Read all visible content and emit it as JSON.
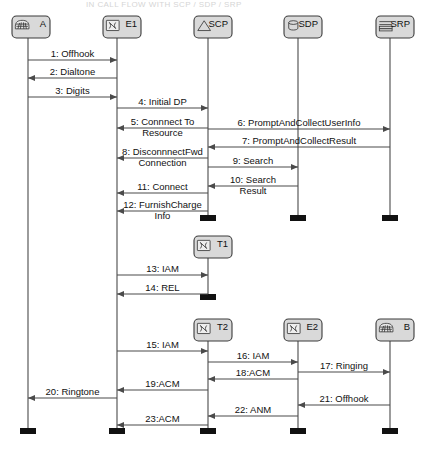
{
  "diagram": {
    "type": "uml-sequence-diagram",
    "title_clipped": "IN CALL FLOW WITH SCP / SDP / SRP",
    "width": 431,
    "height": 455,
    "colors": {
      "line": "#4a4a4a",
      "header_fill": "#d9d9d9",
      "header_stroke": "#3a3a3a",
      "terminator": "#111111",
      "background": "#ffffff",
      "text": "#111111"
    },
    "lifelines": [
      {
        "id": "A",
        "label": "A",
        "icon": "telephone-icon",
        "x": 28,
        "box_x": 12,
        "box_y": 16,
        "top": 38,
        "bottom": 432
      },
      {
        "id": "E1",
        "label": "E1",
        "icon": "switch-icon",
        "x": 117,
        "box_x": 103,
        "box_y": 16,
        "top": 38,
        "bottom": 432
      },
      {
        "id": "SCP",
        "label": "SCP",
        "icon": "triangle-icon",
        "x": 208,
        "box_x": 194,
        "box_y": 16,
        "top": 38,
        "bottom": 219
      },
      {
        "id": "SDP",
        "label": "SDP",
        "icon": "database-icon",
        "x": 298,
        "box_x": 284,
        "box_y": 16,
        "top": 38,
        "bottom": 219
      },
      {
        "id": "SRP",
        "label": "SRP",
        "icon": "resource-icon",
        "x": 390,
        "box_x": 376,
        "box_y": 16,
        "top": 38,
        "bottom": 219
      },
      {
        "id": "T1",
        "label": "T1",
        "icon": "switch-icon",
        "x": 208,
        "box_x": 194,
        "box_y": 236,
        "top": 258,
        "bottom": 298
      },
      {
        "id": "T2",
        "label": "T2",
        "icon": "switch-icon",
        "x": 208,
        "box_x": 194,
        "box_y": 319,
        "top": 341,
        "bottom": 432
      },
      {
        "id": "E2",
        "label": "E2",
        "icon": "switch-icon",
        "x": 298,
        "box_x": 284,
        "box_y": 319,
        "top": 341,
        "bottom": 432
      },
      {
        "id": "B",
        "label": "B",
        "icon": "telephone-icon",
        "x": 390,
        "box_x": 376,
        "box_y": 319,
        "top": 341,
        "bottom": 432
      }
    ],
    "messages": [
      {
        "seq": 1,
        "label": "1: Offhook",
        "from": "A",
        "to": "E1",
        "y": 60,
        "dir": "right",
        "lines": [
          "1: Offhook"
        ]
      },
      {
        "seq": 2,
        "label": "2: Dialtone",
        "from": "E1",
        "to": "A",
        "y": 78,
        "dir": "left",
        "lines": [
          "2: Dialtone"
        ]
      },
      {
        "seq": 3,
        "label": "3: Digits",
        "from": "A",
        "to": "E1",
        "y": 97,
        "dir": "right",
        "lines": [
          "3: Digits"
        ]
      },
      {
        "seq": 4,
        "label": "4: Initial  DP",
        "from": "E1",
        "to": "SCP",
        "y": 108,
        "dir": "right",
        "lines": [
          "4: Initial  DP"
        ]
      },
      {
        "seq": 5,
        "label": "5: Connnect  To Resource",
        "from": "SCP",
        "to": "E1",
        "y": 128,
        "dir": "left",
        "lines": [
          "5: Connnect  To",
          "Resource"
        ]
      },
      {
        "seq": 6,
        "label": "6: PromptAndCollectUserInfo",
        "from": "SCP",
        "to": "SRP",
        "y": 129,
        "dir": "right",
        "lines": [
          "6: PromptAndCollectUserInfo"
        ]
      },
      {
        "seq": 7,
        "label": "7: PromptAndCollectResult",
        "from": "SRP",
        "to": "SCP",
        "y": 147,
        "dir": "left",
        "lines": [
          "7: PromptAndCollectResult"
        ]
      },
      {
        "seq": 8,
        "label": "8: DisconnnectFwd Connection",
        "from": "SCP",
        "to": "E1",
        "y": 158,
        "dir": "left",
        "lines": [
          "8: DisconnnectFwd",
          "Connection"
        ]
      },
      {
        "seq": 9,
        "label": "9: Search",
        "from": "SCP",
        "to": "SDP",
        "y": 167,
        "dir": "right",
        "lines": [
          "9: Search"
        ]
      },
      {
        "seq": 10,
        "label": "10: Search Result",
        "from": "SDP",
        "to": "SCP",
        "y": 186,
        "dir": "left",
        "lines": [
          "10: Search",
          "Result"
        ]
      },
      {
        "seq": 11,
        "label": "11: Connect",
        "from": "SCP",
        "to": "E1",
        "y": 193,
        "dir": "left",
        "lines": [
          "11: Connect"
        ]
      },
      {
        "seq": 12,
        "label": "12: FurnishCharge Info",
        "from": "SCP",
        "to": "E1",
        "y": 211,
        "dir": "left",
        "lines": [
          "12: FurnishCharge",
          "Info"
        ]
      },
      {
        "seq": 13,
        "label": "13: IAM",
        "from": "E1",
        "to": "T1",
        "y": 275,
        "dir": "right",
        "lines": [
          "13: IAM"
        ]
      },
      {
        "seq": 14,
        "label": "14: REL",
        "from": "T1",
        "to": "E1",
        "y": 294,
        "dir": "left",
        "lines": [
          "14: REL"
        ]
      },
      {
        "seq": 15,
        "label": "15: IAM",
        "from": "E1",
        "to": "T2",
        "y": 351,
        "dir": "right",
        "lines": [
          "15: IAM"
        ]
      },
      {
        "seq": 16,
        "label": "16: IAM",
        "from": "T2",
        "to": "E2",
        "y": 362,
        "dir": "right",
        "lines": [
          "16: IAM"
        ]
      },
      {
        "seq": 17,
        "label": "17: Ringing",
        "from": "E2",
        "to": "B",
        "y": 372,
        "dir": "right",
        "lines": [
          "17: Ringing"
        ]
      },
      {
        "seq": 18,
        "label": "18:ACM",
        "from": "E2",
        "to": "T2",
        "y": 379,
        "dir": "left",
        "lines": [
          "18:ACM"
        ]
      },
      {
        "seq": 19,
        "label": "19:ACM",
        "from": "T2",
        "to": "E1",
        "y": 390,
        "dir": "left",
        "lines": [
          "19:ACM"
        ]
      },
      {
        "seq": 20,
        "label": "20: Ringtone",
        "from": "E1",
        "to": "A",
        "y": 398,
        "dir": "left",
        "lines": [
          "20: Ringtone"
        ]
      },
      {
        "seq": 21,
        "label": "21: Offhook",
        "from": "B",
        "to": "E2",
        "y": 405,
        "dir": "left",
        "lines": [
          "21: Offhook"
        ]
      },
      {
        "seq": 22,
        "label": "22: ANM",
        "from": "E2",
        "to": "T2",
        "y": 416,
        "dir": "left",
        "lines": [
          "22: ANM"
        ]
      },
      {
        "seq": 23,
        "label": "23:ACM",
        "from": "T2",
        "to": "E1",
        "y": 425,
        "dir": "left",
        "lines": [
          "23:ACM"
        ]
      }
    ]
  }
}
